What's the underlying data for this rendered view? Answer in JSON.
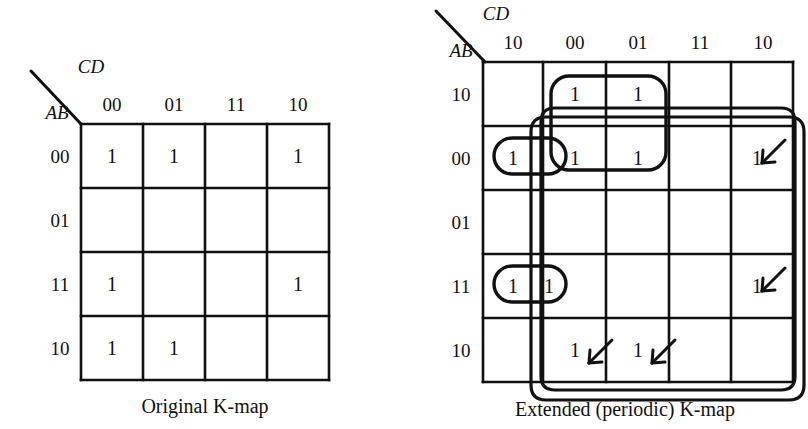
{
  "figure": {
    "ink_color": "#111111",
    "background": "#ffffff"
  },
  "maps": [
    {
      "id": "original",
      "caption": "Original K-map",
      "axis_top_label": "CD",
      "axis_left_label": "AB",
      "col_headers": [
        "00",
        "01",
        "11",
        "10"
      ],
      "row_headers": [
        "00",
        "01",
        "11",
        "10"
      ],
      "cells": [
        [
          "1",
          "1",
          "",
          "1"
        ],
        [
          "",
          "",
          "",
          ""
        ],
        [
          "1",
          "",
          "",
          "1"
        ],
        [
          "1",
          "1",
          "",
          ""
        ]
      ]
    },
    {
      "id": "extended",
      "caption": "Extended (periodic) K-map",
      "axis_top_label": "CD",
      "axis_left_label": "AB",
      "col_headers": [
        "10",
        "00",
        "01",
        "11",
        "10"
      ],
      "row_headers": [
        "10",
        "00",
        "01",
        "11",
        "10"
      ],
      "cells": [
        [
          "",
          "1",
          "1",
          "",
          ""
        ],
        [
          "1",
          "1",
          "1",
          "",
          "1"
        ],
        [
          "",
          "",
          "",
          "",
          ""
        ],
        [
          "1",
          "1",
          "",
          "",
          "1"
        ],
        [
          "",
          "1",
          "1",
          "",
          ""
        ]
      ],
      "groups": [
        {
          "name": "group-2x2-top",
          "note": "encircles the 1s in rows 10/00 at columns 00 and 01"
        },
        {
          "name": "group-pair-row00-left",
          "note": "encircles the 1s in row 00 at the wrapped 10 column and the 00 column"
        },
        {
          "name": "group-pair-row11-left",
          "note": "encircles the 1s in row 11 at the wrapped 10 column and the 00 column"
        },
        {
          "name": "group-corners-wrap",
          "note": "large wrap-around loop joining the four corner 1s through the periodic edges"
        }
      ],
      "wrap_arrows": 4
    }
  ]
}
